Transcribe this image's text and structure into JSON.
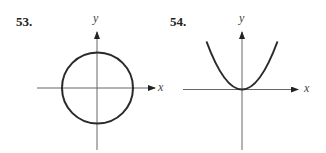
{
  "problems": [
    {
      "number": "53.",
      "axes": {
        "x_label": "x",
        "y_label": "y"
      },
      "curve": {
        "type": "circle",
        "center": [
          0,
          0
        ],
        "radius": 1
      }
    },
    {
      "number": "54.",
      "axes": {
        "x_label": "x",
        "y_label": "y"
      },
      "curve": {
        "type": "parabola",
        "vertex": [
          0,
          0
        ],
        "opens": "up"
      }
    }
  ],
  "colors": {
    "axis": "#555555",
    "curve": "#2a2a2a",
    "text": "#222222"
  }
}
